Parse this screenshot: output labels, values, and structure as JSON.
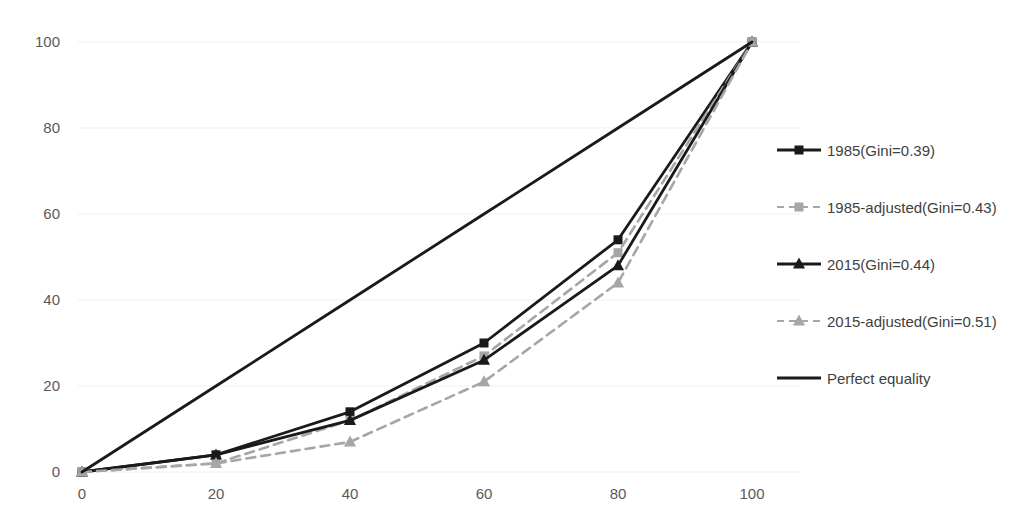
{
  "chart_data": {
    "type": "line",
    "title": "",
    "subtitle": "",
    "xlabel": "",
    "ylabel": "",
    "xlim": [
      0,
      100
    ],
    "ylim": [
      0,
      100
    ],
    "xticks": [
      0,
      20,
      40,
      60,
      80,
      100
    ],
    "yticks": [
      0,
      20,
      40,
      60,
      80,
      100
    ],
    "grid": "horizontal",
    "legend_position": "right",
    "x": [
      0,
      20,
      40,
      60,
      80,
      100
    ],
    "series": [
      {
        "name": "1985(Gini=0.39)",
        "values": [
          0,
          4,
          14,
          30,
          54,
          100
        ],
        "color": "#1a1a1a",
        "style": "solid",
        "marker": "square"
      },
      {
        "name": "1985-adjusted(Gini=0.43)",
        "values": [
          0,
          2,
          12,
          27,
          51,
          100
        ],
        "color": "#a6a6a6",
        "style": "dashed",
        "marker": "square"
      },
      {
        "name": "2015(Gini=0.44)",
        "values": [
          0,
          4,
          12,
          26,
          48,
          100
        ],
        "color": "#1a1a1a",
        "style": "solid",
        "marker": "triangle"
      },
      {
        "name": "2015-adjusted(Gini=0.51)",
        "values": [
          0,
          2,
          7,
          21,
          44,
          100
        ],
        "color": "#a6a6a6",
        "style": "dashed",
        "marker": "triangle"
      },
      {
        "name": "Perfect equality",
        "values": [
          0,
          20,
          40,
          60,
          80,
          100
        ],
        "color": "#1a1a1a",
        "style": "solid",
        "marker": "none"
      }
    ]
  },
  "axes": {
    "y_tick_labels": [
      "100",
      "80",
      "60",
      "40",
      "20",
      "0"
    ],
    "x_tick_labels": [
      "0",
      "20",
      "40",
      "60",
      "80",
      "100"
    ]
  },
  "legend": {
    "items": [
      {
        "label": "1985(Gini=0.39)"
      },
      {
        "label": "1985-adjusted(Gini=0.43)"
      },
      {
        "label": "2015(Gini=0.44)"
      },
      {
        "label": "2015-adjusted(Gini=0.51)"
      },
      {
        "label": "Perfect equality"
      }
    ]
  }
}
